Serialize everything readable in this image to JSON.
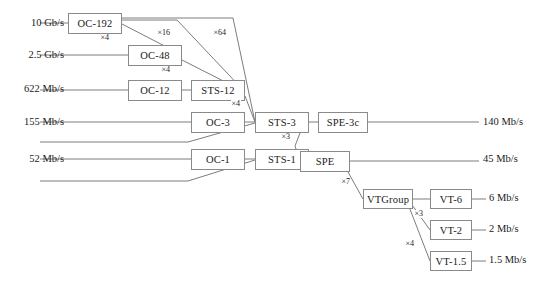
{
  "diagram": {
    "stroke_color": "#7d7d7d",
    "box_border_color": "#8a8a8a",
    "text_color": "#1a1a1a",
    "background": "#ffffff"
  },
  "nodes": [
    {
      "id": "oc192",
      "label": "OC-192",
      "x": 68,
      "y": 13,
      "w": 54,
      "h": 21
    },
    {
      "id": "oc48",
      "label": "OC-48",
      "x": 128,
      "y": 45,
      "w": 54,
      "h": 21
    },
    {
      "id": "oc12",
      "label": "OC-12",
      "x": 128,
      "y": 80,
      "w": 54,
      "h": 21
    },
    {
      "id": "sts12",
      "label": "STS-12",
      "x": 191,
      "y": 80,
      "w": 54,
      "h": 21
    },
    {
      "id": "oc3",
      "label": "OC-3",
      "x": 191,
      "y": 112,
      "w": 54,
      "h": 21
    },
    {
      "id": "sts3",
      "label": "STS-3",
      "x": 255,
      "y": 112,
      "w": 54,
      "h": 21
    },
    {
      "id": "spe3c",
      "label": "SPE-3c",
      "x": 318,
      "y": 112,
      "w": 50,
      "h": 21
    },
    {
      "id": "oc1",
      "label": "OC-1",
      "x": 191,
      "y": 149,
      "w": 54,
      "h": 21
    },
    {
      "id": "sts1",
      "label": "STS-1",
      "x": 255,
      "y": 149,
      "w": 54,
      "h": 21
    },
    {
      "id": "spe",
      "label": "SPE",
      "x": 300,
      "y": 151,
      "w": 50,
      "h": 21
    },
    {
      "id": "vtgroup",
      "label": "VTGroup",
      "x": 363,
      "y": 189,
      "w": 50,
      "h": 20
    },
    {
      "id": "vt6",
      "label": "VT-6",
      "x": 430,
      "y": 189,
      "w": 42,
      "h": 20
    },
    {
      "id": "vt2",
      "label": "VT-2",
      "x": 430,
      "y": 220,
      "w": 42,
      "h": 20
    },
    {
      "id": "vt15",
      "label": "VT-1.5",
      "x": 430,
      "y": 251,
      "w": 42,
      "h": 20
    }
  ],
  "rates_left": [
    {
      "id": "r-10g",
      "label": "10 Gb/s",
      "x": 8,
      "y": 17,
      "w": 56
    },
    {
      "id": "r-25g",
      "label": "2.5 Gb/s",
      "x": 8,
      "y": 49,
      "w": 56
    },
    {
      "id": "r-622m",
      "label": "622 Mb/s",
      "x": 2,
      "y": 83,
      "w": 62
    },
    {
      "id": "r-155m",
      "label": "155 Mb/s",
      "x": 2,
      "y": 116,
      "w": 62
    },
    {
      "id": "r-52m",
      "label": "52 Mb/s",
      "x": 8,
      "y": 153,
      "w": 56
    }
  ],
  "rates_right": [
    {
      "id": "r-140m",
      "label": "140 Mb/s",
      "x": 483,
      "y": 116
    },
    {
      "id": "r-45m",
      "label": "45 Mb/s",
      "x": 483,
      "y": 153
    },
    {
      "id": "r-6m",
      "label": "6 Mb/s",
      "x": 489,
      "y": 192
    },
    {
      "id": "r-2m",
      "label": "2 Mb/s",
      "x": 489,
      "y": 223
    },
    {
      "id": "r-15m",
      "label": "1.5 Mb/s",
      "x": 489,
      "y": 254
    }
  ],
  "multipliers": [
    {
      "id": "m-oc192-oc48",
      "label": "×4",
      "x": 100,
      "y": 34
    },
    {
      "id": "m-oc192-sts12",
      "label": "×16",
      "x": 157,
      "y": 29
    },
    {
      "id": "m-oc192-sts3",
      "label": "×64",
      "x": 213,
      "y": 29
    },
    {
      "id": "m-oc48-sts12",
      "label": "×4",
      "x": 161,
      "y": 66
    },
    {
      "id": "m-sts12-sts3",
      "label": "×4",
      "x": 231,
      "y": 100
    },
    {
      "id": "m-sts3-spe",
      "label": "×3",
      "x": 281,
      "y": 133
    },
    {
      "id": "m-spe-vtgroup",
      "label": "×7",
      "x": 341,
      "y": 178
    },
    {
      "id": "m-vtg-vt2",
      "label": "×3",
      "x": 414,
      "y": 210
    },
    {
      "id": "m-vtg-vt15",
      "label": "×4",
      "x": 405,
      "y": 240
    }
  ],
  "wires": [
    {
      "id": "w-rate10g-oc192",
      "points": "40,23 68,23"
    },
    {
      "id": "w-rate25g-oc48",
      "points": "40,55 128,55"
    },
    {
      "id": "w-rate622m-oc12",
      "points": "40,90 128,90"
    },
    {
      "id": "w-rate155m-oc3",
      "points": "40,122 191,122"
    },
    {
      "id": "w-rate155m-sts3",
      "points": "40,142 188,142 255,123"
    },
    {
      "id": "w-rate52m-oc1",
      "points": "40,159 191,159"
    },
    {
      "id": "w-rate52m-sts1",
      "points": "40,181 188,181 255,160"
    },
    {
      "id": "w-oc192-oc48",
      "points": "122,24 182,55"
    },
    {
      "id": "w-oc192-sts12",
      "points": "122,20 177,20 245,92"
    },
    {
      "id": "w-oc192-sts3",
      "points": "122,18 233,18 255,122"
    },
    {
      "id": "w-oc48-sts12",
      "points": "182,60 245,92"
    },
    {
      "id": "w-oc12-sts12",
      "points": "182,90 191,90"
    },
    {
      "id": "w-sts12-sts3",
      "points": "245,96 255,122"
    },
    {
      "id": "w-oc3-sts3",
      "points": "245,122 255,122"
    },
    {
      "id": "w-sts3-spe3c",
      "points": "309,122 318,122"
    },
    {
      "id": "w-spe3c-140m",
      "points": "368,122 479,122"
    },
    {
      "id": "w-sts3-spe",
      "points": "300,133 295,146 300,161"
    },
    {
      "id": "w-oc1-sts1",
      "points": "245,159 255,159"
    },
    {
      "id": "w-sts1-spe",
      "points": "309,161 300,161"
    },
    {
      "id": "w-spe-45m",
      "points": "350,161 479,161"
    },
    {
      "id": "w-spe-vtgroup",
      "points": "348,172 363,199"
    },
    {
      "id": "w-vtgroup-vt6",
      "points": "413,199 430,199"
    },
    {
      "id": "w-vtgroup-vt2",
      "points": "410,202 430,230"
    },
    {
      "id": "w-vtgroup-vt15",
      "points": "408,204 430,261"
    },
    {
      "id": "w-vt6-6m",
      "points": "472,199 486,199"
    },
    {
      "id": "w-vt2-2m",
      "points": "472,230 486,230"
    },
    {
      "id": "w-vt15-15m",
      "points": "472,261 486,261"
    }
  ]
}
